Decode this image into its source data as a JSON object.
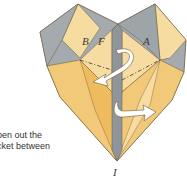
{
  "diagram": {
    "labels": {
      "b": "B",
      "f": "F",
      "a": "A",
      "bottom": "I"
    },
    "colors": {
      "gray": "#a4aaae",
      "gray_dark": "#8f969b",
      "yellow_light": "#f6dca0",
      "yellow": "#f2c978",
      "orange": "#eebb5e",
      "line": "#6b5a3a",
      "arrow": "#ffffff"
    }
  },
  "caption": {
    "line1": "pen out the",
    "line2": "cket between",
    "line3": "-"
  }
}
